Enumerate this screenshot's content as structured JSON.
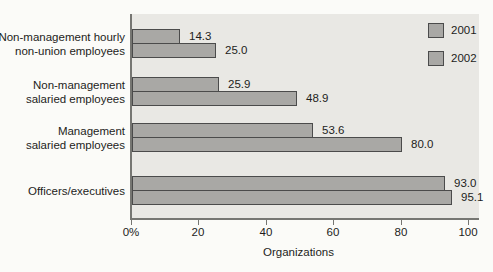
{
  "chart_data": {
    "type": "bar",
    "orientation": "horizontal",
    "title": "",
    "xlabel": "Organizations",
    "ylabel": "",
    "categories": [
      "Non-management hourly non-union employees",
      "Non-management salaried employees",
      "Management salaried employees",
      "Officers/executives"
    ],
    "category_lines": [
      [
        "Non-management hourly",
        "non-union employees"
      ],
      [
        "Non-management",
        "salaried employees"
      ],
      [
        "Management",
        "salaried employees"
      ],
      [
        "Officers/executives"
      ]
    ],
    "series": [
      {
        "name": "2001",
        "values": [
          14.3,
          25.9,
          53.6,
          93.0
        ],
        "labels": [
          "14.3",
          "25.9",
          "53.6",
          "93.0"
        ]
      },
      {
        "name": "2002",
        "values": [
          25.0,
          48.9,
          80.0,
          95.1
        ],
        "labels": [
          "25.0",
          "48.9",
          "80.0",
          "95.1"
        ]
      }
    ],
    "x_axis": {
      "tick_values": [
        0,
        20,
        40,
        60,
        80,
        100
      ],
      "tick_labels": [
        "0%",
        "20",
        "40",
        "60",
        "80",
        "100"
      ],
      "xlim": [
        0,
        103
      ]
    },
    "legend": {
      "position": "top-right",
      "entries": [
        "2001",
        "2002"
      ]
    },
    "grid": "off",
    "colors": {
      "bar_fill": "#a9a8a5",
      "bar_border": "#4b4b4b",
      "plot_bg": "#e9e8e4",
      "page_bg": "#fbfbf8",
      "axis": "#767672",
      "text": "#1d1d1b"
    }
  }
}
